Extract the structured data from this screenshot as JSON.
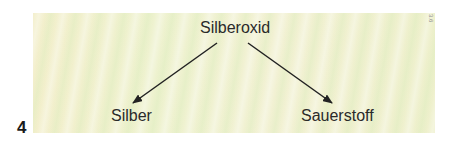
{
  "diagram": {
    "root": {
      "label": "Silberoxid"
    },
    "children": [
      {
        "label": "Silber"
      },
      {
        "label": "Sauerstoff"
      }
    ],
    "edges": [
      {
        "from": "Silberoxid",
        "to": "Silber"
      },
      {
        "from": "Silberoxid",
        "to": "Sauerstoff"
      }
    ]
  },
  "figure_number": "4",
  "side_code": "3.6",
  "colors": {
    "panel_background": "#f0f0cf",
    "text": "#2a2a2a",
    "arrow": "#222222"
  }
}
